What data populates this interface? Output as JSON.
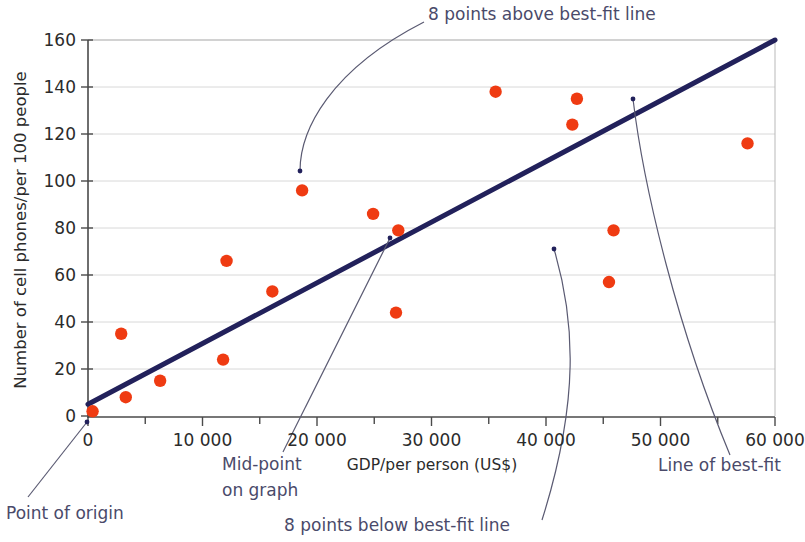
{
  "chart_data": {
    "type": "scatter",
    "title": "",
    "xlabel": "GDP/per person (US$)",
    "ylabel": "Number of cell phones/per 100 people",
    "xlim": [
      0,
      60000
    ],
    "ylim": [
      0,
      160
    ],
    "xticks": [
      0,
      10000,
      20000,
      30000,
      40000,
      50000,
      60000
    ],
    "xticklabels": [
      "0",
      "10 000",
      "20 000",
      "30 000",
      "40 000",
      "50 000",
      "60 000"
    ],
    "yticks": [
      0,
      20,
      40,
      60,
      80,
      100,
      120,
      140,
      160
    ],
    "yticklabels": [
      "0",
      "20",
      "40",
      "60",
      "80",
      "100",
      "120",
      "140",
      "160"
    ],
    "grid": "horizontal",
    "legend": "none",
    "marker_color": "#ef3b12",
    "fitline_color": "#22215b",
    "annotation_color": "#4a4a6a",
    "points": [
      {
        "x": 400,
        "y": 2
      },
      {
        "x": 2900,
        "y": 35
      },
      {
        "x": 3300,
        "y": 8
      },
      {
        "x": 6300,
        "y": 15
      },
      {
        "x": 11800,
        "y": 24
      },
      {
        "x": 12100,
        "y": 66
      },
      {
        "x": 16100,
        "y": 53
      },
      {
        "x": 18700,
        "y": 96
      },
      {
        "x": 24900,
        "y": 86
      },
      {
        "x": 26900,
        "y": 44
      },
      {
        "x": 27100,
        "y": 79
      },
      {
        "x": 35600,
        "y": 138
      },
      {
        "x": 42300,
        "y": 124
      },
      {
        "x": 42700,
        "y": 135
      },
      {
        "x": 45500,
        "y": 57
      },
      {
        "x": 45900,
        "y": 79
      },
      {
        "x": 57600,
        "y": 116
      }
    ],
    "fit_line": {
      "x0": 0,
      "y0": 5,
      "x1": 60000,
      "y1": 160
    },
    "series_name": "countries",
    "annotations": [
      {
        "id": "above",
        "text": "8 points above best-fit line",
        "anchor_x": 18600,
        "anchor_y": 103
      },
      {
        "id": "midpoint",
        "text_line1": "Mid-point",
        "text_line2": "on graph",
        "anchor_x": 26500,
        "anchor_y": 76
      },
      {
        "id": "below",
        "text": "8 points below best-fit line",
        "anchor_x": 41000,
        "anchor_y": 71
      },
      {
        "id": "bestfit",
        "text": "Line of best-fit",
        "anchor_x": 47500,
        "anchor_y": 133
      },
      {
        "id": "origin",
        "text": "Point of origin",
        "anchor_x": 0,
        "anchor_y": 0
      }
    ]
  },
  "annotations": {
    "above_label": "8 points above best-fit line",
    "midpoint_line1": "Mid-point",
    "midpoint_line2": "on graph",
    "below_label": "8 points below best-fit line",
    "bestfit_label": "Line of best-fit",
    "origin_label": "Point of origin"
  },
  "axes": {
    "x_title": "GDP/per person (US$)",
    "y_title": "Number of cell phones/per 100 people",
    "x_tick_labels": [
      "0",
      "10 000",
      "20 000",
      "30 000",
      "40 000",
      "50 000",
      "60 000"
    ],
    "y_tick_labels": [
      "0",
      "20",
      "40",
      "60",
      "80",
      "100",
      "120",
      "140",
      "160"
    ]
  }
}
